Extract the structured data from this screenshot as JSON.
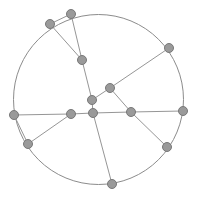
{
  "diagram": {
    "type": "node-link-diagram",
    "width": 197,
    "height": 199,
    "background_color": "#ffffff",
    "style": {
      "circle_stroke_color": "#8c8c8c",
      "circle_stroke_width": 1,
      "edge_stroke_color": "#969696",
      "edge_stroke_width": 1,
      "node_fill_color": "#9a9a9a",
      "node_stroke_color": "#787878",
      "node_radius": 4.5
    },
    "circle": {
      "center_x": 98.5,
      "center_y": 99.5,
      "radius": 85
    },
    "nodes": [
      {
        "id": "n0",
        "label": "top",
        "x": 71,
        "y": 14,
        "on_circle": true
      },
      {
        "id": "n1",
        "label": "upper-left",
        "x": 50,
        "y": 24,
        "on_circle": true
      },
      {
        "id": "n2",
        "label": "upper-right",
        "x": 169,
        "y": 48,
        "on_circle": true
      },
      {
        "id": "n3",
        "label": "left",
        "x": 14,
        "y": 115,
        "on_circle": true
      },
      {
        "id": "n4",
        "label": "lower-left",
        "x": 28,
        "y": 144,
        "on_circle": true
      },
      {
        "id": "n5",
        "label": "right",
        "x": 183,
        "y": 111,
        "on_circle": true
      },
      {
        "id": "n6",
        "label": "lower-right",
        "x": 167,
        "y": 147,
        "on_circle": true
      },
      {
        "id": "n7",
        "label": "bottom",
        "x": 112,
        "y": 184,
        "on_circle": true
      },
      {
        "id": "n8",
        "label": "inner-upper",
        "x": 82,
        "y": 60,
        "on_circle": false
      },
      {
        "id": "n9",
        "label": "inner-hub",
        "x": 110,
        "y": 88,
        "on_circle": false
      },
      {
        "id": "n10",
        "label": "inner-mid",
        "x": 92,
        "y": 100,
        "on_circle": false
      },
      {
        "id": "n11",
        "label": "inner-center",
        "x": 93,
        "y": 113,
        "on_circle": false
      },
      {
        "id": "n12",
        "label": "inner-left",
        "x": 71,
        "y": 114,
        "on_circle": false
      },
      {
        "id": "n13",
        "label": "inner-right",
        "x": 131,
        "y": 112,
        "on_circle": false
      }
    ],
    "edges": [
      {
        "from": "n3",
        "to": "n12"
      },
      {
        "from": "n12",
        "to": "n11"
      },
      {
        "from": "n11",
        "to": "n13"
      },
      {
        "from": "n13",
        "to": "n5"
      },
      {
        "from": "n0",
        "to": "n8"
      },
      {
        "from": "n8",
        "to": "n10"
      },
      {
        "from": "n10",
        "to": "n11"
      },
      {
        "from": "n11",
        "to": "n7"
      },
      {
        "from": "n1",
        "to": "n8"
      },
      {
        "from": "n1",
        "to": "n0"
      },
      {
        "from": "n2",
        "to": "n9"
      },
      {
        "from": "n9",
        "to": "n10"
      },
      {
        "from": "n9",
        "to": "n13"
      },
      {
        "from": "n13",
        "to": "n6"
      },
      {
        "from": "n4",
        "to": "n12"
      },
      {
        "from": "n4",
        "to": "n3"
      }
    ],
    "node_count": 14,
    "edge_count": 16
  }
}
